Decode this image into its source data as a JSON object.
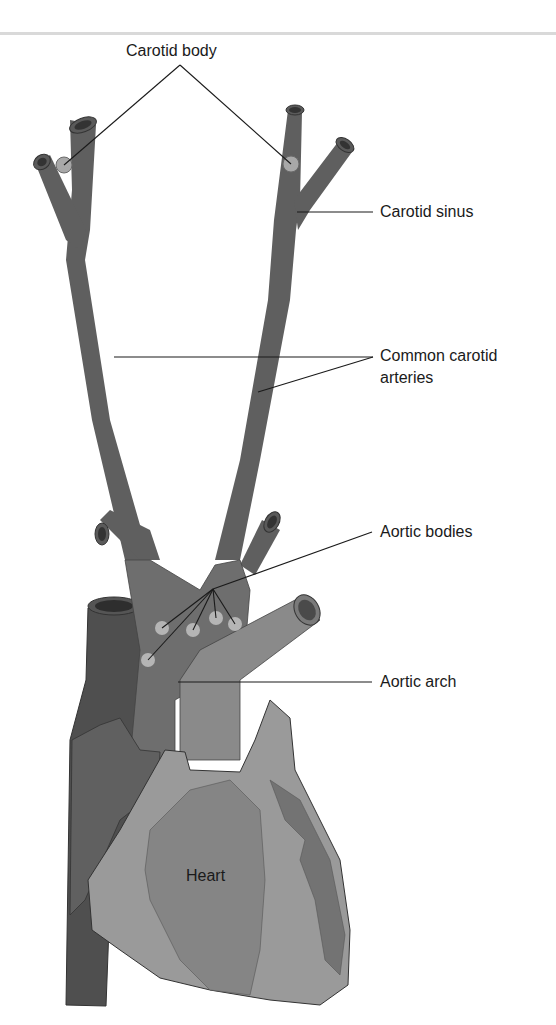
{
  "figure": {
    "labels": {
      "carotid_body": "Carotid body",
      "carotid_sinus": "Carotid sinus",
      "common_carotid_line1": "Common carotid",
      "common_carotid_line2": "arteries",
      "aortic_bodies": "Aortic bodies",
      "aortic_arch": "Aortic arch",
      "heart": "Heart"
    },
    "colors": {
      "vessel": "#5f5f5f",
      "vessel_dark": "#4d4d4d",
      "aorta": "#7a7a7a",
      "heart_light": "#9a9a9a",
      "heart_mid": "#858585",
      "heart_dark": "#6e6e6e",
      "chemoreceptor": "#b5b5b5",
      "leader_line": "#1a1a1a",
      "rule": "#d9d9d9"
    }
  }
}
